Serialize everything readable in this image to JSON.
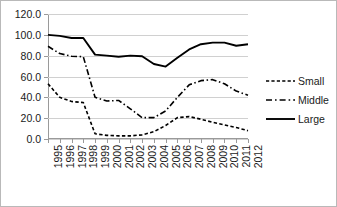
{
  "chart_data": {
    "type": "line",
    "title": "",
    "xlabel": "",
    "ylabel": "",
    "categories": [
      "1995",
      "1996",
      "1997",
      "1998",
      "1999",
      "2000",
      "2001",
      "2002",
      "2003",
      "2004",
      "2005",
      "2006",
      "2007",
      "2008",
      "2009",
      "2010",
      "2011",
      "2012"
    ],
    "ylim": [
      0,
      120
    ],
    "ytick_values": [
      0,
      20,
      40,
      60,
      80,
      100,
      120
    ],
    "ytick_labels": [
      "0.0",
      "20.0",
      "40.0",
      "60.0",
      "80.0",
      "100.0",
      "120.0"
    ],
    "grid": "horizontal",
    "legend_position": "right",
    "series": [
      {
        "name": "Small",
        "style": "dashed",
        "color": "#000000",
        "values": [
          53.0,
          40.0,
          36.0,
          35.0,
          5.0,
          3.5,
          3.0,
          3.0,
          4.0,
          7.0,
          13.0,
          20.5,
          21.5,
          19.0,
          16.0,
          13.5,
          11.0,
          8.0
        ]
      },
      {
        "name": "Middle",
        "style": "dash-dot",
        "color": "#000000",
        "values": [
          89.0,
          82.0,
          79.5,
          79.0,
          40.0,
          36.5,
          37.0,
          29.0,
          20.5,
          20.5,
          27.0,
          40.0,
          52.0,
          56.0,
          57.0,
          53.0,
          46.0,
          42.0
        ]
      },
      {
        "name": "Large",
        "style": "solid",
        "color": "#000000",
        "values": [
          100.0,
          99.0,
          97.0,
          97.0,
          81.0,
          80.0,
          79.0,
          80.0,
          79.5,
          72.0,
          69.5,
          78.0,
          86.0,
          91.0,
          92.5,
          92.5,
          89.5,
          91.0
        ]
      }
    ]
  },
  "legend": {
    "entries": [
      {
        "label": "Small"
      },
      {
        "label": "Middle"
      },
      {
        "label": "Large"
      }
    ]
  }
}
